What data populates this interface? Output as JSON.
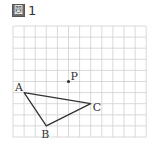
{
  "figure": {
    "label_icon": "図",
    "label_number": "1"
  },
  "grid": {
    "columns": 12,
    "rows": 10,
    "line_color": "#cfcfcf"
  },
  "points": {
    "A": {
      "label": "A",
      "x": 1,
      "y": 6
    },
    "B": {
      "label": "B",
      "x": 3,
      "y": 9
    },
    "C": {
      "label": "C",
      "x": 7,
      "y": 7
    },
    "P": {
      "label": "P",
      "x": 5,
      "y": 5
    }
  },
  "triangle": [
    "A",
    "B",
    "C"
  ],
  "colors": {
    "stroke": "#333333",
    "text": "#333333"
  }
}
